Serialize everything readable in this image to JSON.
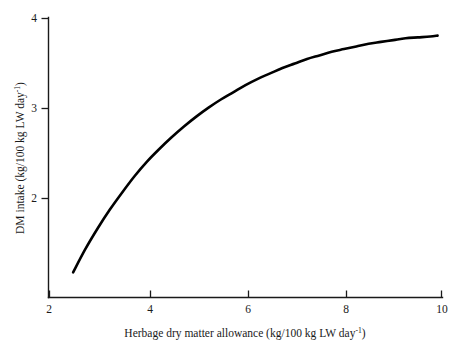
{
  "chart_data": {
    "type": "line",
    "title": "",
    "xlabel": "Herbage dry matter allowance (kg/100 kg LW day",
    "xlabel_sup": "-1",
    "xlabel_tail": ")",
    "ylabel": "DM intake (kg/100 kg LW day",
    "ylabel_sup": "-1",
    "ylabel_tail": ")",
    "xlim": [
      2,
      10
    ],
    "ylim": [
      1.1,
      4
    ],
    "xticks": [
      2,
      4,
      6,
      8,
      10
    ],
    "xtick_labels": [
      "2",
      "4",
      "6",
      "8",
      "10"
    ],
    "yticks": [
      2,
      3,
      4
    ],
    "ytick_labels": [
      "2",
      "3",
      "4"
    ],
    "grid": false,
    "legend": false,
    "series": [
      {
        "name": "DM intake response",
        "x": [
          2.5,
          2.75,
          3.0,
          3.25,
          3.5,
          3.75,
          4.0,
          4.25,
          4.5,
          4.75,
          5.0,
          5.25,
          5.5,
          5.75,
          6.0,
          6.25,
          6.5,
          6.75,
          7.0,
          7.25,
          7.5,
          7.75,
          8.0,
          8.25,
          8.5,
          8.75,
          9.0,
          9.25,
          9.5,
          9.75,
          9.9
        ],
        "y": [
          1.18,
          1.44,
          1.67,
          1.88,
          2.07,
          2.25,
          2.41,
          2.55,
          2.68,
          2.8,
          2.91,
          3.01,
          3.1,
          3.18,
          3.26,
          3.33,
          3.39,
          3.45,
          3.5,
          3.55,
          3.59,
          3.63,
          3.66,
          3.69,
          3.72,
          3.74,
          3.76,
          3.78,
          3.79,
          3.8,
          3.81
        ]
      }
    ],
    "curve_color": "#000000",
    "axis_color": "#1a1a1a"
  },
  "figure": {
    "background": "#ffffff"
  }
}
